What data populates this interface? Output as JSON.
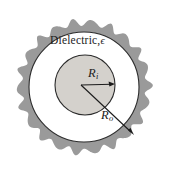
{
  "figure": {
    "name": "coaxial-cable-cross-section",
    "canvas": {
      "width": 171,
      "height": 171,
      "background": "#ffffff"
    },
    "labels": {
      "dielectric": "Dielectric,",
      "dielectric_symbol": "ϵ",
      "inner_radius": "R",
      "inner_radius_sub": "i",
      "outer_radius": "R",
      "outer_radius_sub": "o"
    },
    "colors": {
      "outer_shell_fill": "#9a9a9a",
      "outer_shell_stroke": "#8e8e8e",
      "dielectric_fill": "#ffffff",
      "inner_conductor_fill": "#d4d1cc",
      "outline_stroke": "#2b2b2b",
      "text": "#1b1b1b"
    },
    "geometry": {
      "center_x": 84,
      "center_y": 87,
      "outer_shell_outer_radius": 68,
      "outer_shell_inner_radius": 55,
      "inner_conductor_center_x": 85,
      "inner_conductor_center_y": 85,
      "inner_conductor_radius": 30,
      "wave_count": 22,
      "wave_amplitude": 3.2,
      "ri_arrow": {
        "x1": 81,
        "y1": 85,
        "x2": 114,
        "y2": 84
      },
      "ro_arrow": {
        "x1": 81,
        "y1": 85,
        "x2": 133,
        "y2": 134
      }
    }
  },
  "chart_data": {
    "type": "diagram",
    "regions": [
      {
        "name": "outer-conductor-shell",
        "shape": "wavy-annulus",
        "fill": "#9a9a9a",
        "inner_radius": 55,
        "outer_radius": 68
      },
      {
        "name": "dielectric-region",
        "shape": "annulus",
        "fill": "#ffffff",
        "inner_radius": 30,
        "outer_radius": 55,
        "label": "Dielectric, ϵ"
      },
      {
        "name": "inner-conductor",
        "shape": "disc",
        "fill": "#d4d1cc",
        "radius": 30
      }
    ],
    "annotations": [
      {
        "name": "inner-radius-arrow",
        "label": "R_i",
        "from": "center",
        "to": "inner-conductor-edge"
      },
      {
        "name": "outer-radius-arrow",
        "label": "R_o",
        "from": "center",
        "to": "dielectric-outer-edge"
      }
    ]
  }
}
